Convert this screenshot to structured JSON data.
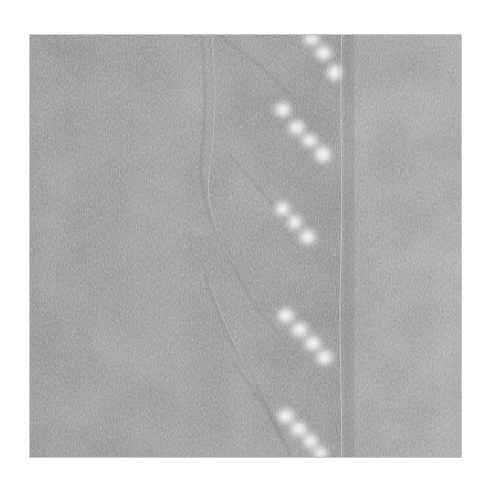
{
  "image": {
    "description": "Grayscale close-up photograph of knitted lace fabric with a diagonal eyelet pattern",
    "background_color": "#ffffff",
    "fabric_color": "#9a9a9a",
    "fabric_light": "#aaaaaa",
    "fabric_dark": "#888888",
    "eyelet_color": "#f2f2f2",
    "frame": {
      "x": 29,
      "y": 34,
      "width": 433,
      "height": 424
    },
    "eyelet_clusters": [
      {
        "name": "top",
        "holes": [
          [
            283,
            38
          ],
          [
            295,
            50
          ],
          [
            306,
            62
          ]
        ]
      },
      {
        "name": "upper",
        "holes": [
          [
            254,
            75
          ],
          [
            268,
            93
          ],
          [
            281,
            110
          ],
          [
            294,
            120
          ]
        ]
      },
      {
        "name": "middle",
        "holes": [
          [
            254,
            175
          ],
          [
            266,
            188
          ],
          [
            279,
            203
          ]
        ]
      },
      {
        "name": "lower",
        "holes": [
          [
            257,
            280
          ],
          [
            271,
            294
          ],
          [
            284,
            307
          ],
          [
            296,
            322
          ]
        ]
      },
      {
        "name": "bottom",
        "holes": [
          [
            257,
            381
          ],
          [
            270,
            394
          ],
          [
            282,
            408
          ],
          [
            292,
            420
          ]
        ]
      }
    ],
    "seam_x": 313
  }
}
